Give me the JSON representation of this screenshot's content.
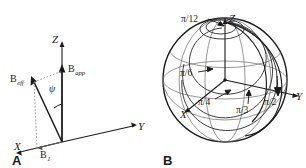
{
  "figure": {
    "background": "#ffffff",
    "ink": "#1a1a1a",
    "width": 306,
    "height": 168
  },
  "panels": [
    {
      "id": "A",
      "letter": "A",
      "name": "effective-field-vector-diagram",
      "axes": [
        {
          "name": "z-axis",
          "label": "Z"
        },
        {
          "name": "y-axis",
          "label": "Y"
        },
        {
          "name": "x-axis",
          "label": "X"
        }
      ],
      "vectors": [
        {
          "name": "b-app-vector",
          "symbol": "B",
          "subscript": "app",
          "direction": "+Z"
        },
        {
          "name": "b-eff-vector",
          "symbol": "B",
          "subscript": "eff",
          "direction": "tilted"
        },
        {
          "name": "b1-vector",
          "symbol": "B",
          "subscript": "1",
          "direction": "+X"
        }
      ],
      "angle": {
        "name": "psi-angle",
        "label": "ψ",
        "between": [
          "B_eff",
          "B_app"
        ]
      }
    },
    {
      "id": "B",
      "letter": "B",
      "name": "bloch-sphere-trajectories",
      "axes": [
        {
          "name": "z-axis",
          "label": "Z"
        },
        {
          "name": "y-axis",
          "label": "Y"
        },
        {
          "name": "x-axis",
          "label": "X"
        }
      ],
      "trajectory_labels": [
        {
          "name": "label-pi-over-12",
          "text": "π/12"
        },
        {
          "name": "label-pi-over-6",
          "text": "π/6"
        },
        {
          "name": "label-pi-over-4",
          "text": "π/4"
        },
        {
          "name": "label-pi-over-3",
          "text": "π/3"
        },
        {
          "name": "label-pi-over-2",
          "text": "π/2"
        }
      ]
    }
  ]
}
